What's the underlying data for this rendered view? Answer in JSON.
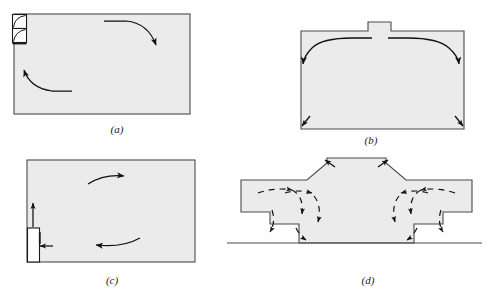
{
  "figure": {
    "panel_count": 4,
    "colors": {
      "background": "#ffffff",
      "room_fill": "#ebebeb",
      "outline": "#4a4a4a",
      "arrow": "#111111",
      "caption": "#1a1a1a",
      "appliance_fill": "#ffffff"
    }
  },
  "panels": [
    {
      "id": "a",
      "caption": "(a)",
      "caption_x": 117,
      "caption_y": 133,
      "description": "Rectangular room with wall-mounted unit on upper left; two curved convection arrows",
      "room": {
        "x": 14,
        "y": 14,
        "width": 176,
        "height": 100
      },
      "features": [
        {
          "name": "wall-unit-upper",
          "x": 13,
          "y": 15,
          "width": 14,
          "height": 14
        },
        {
          "name": "wall-unit-lower",
          "x": 13,
          "y": 29,
          "width": 14,
          "height": 14
        }
      ],
      "arrows": [
        {
          "name": "upper-arc-arrow",
          "direction": "right-then-down"
        },
        {
          "name": "lower-arc-arrow",
          "direction": "left-then-up"
        }
      ]
    },
    {
      "id": "b",
      "caption": "(b)",
      "caption_x": 371,
      "caption_y": 144,
      "description": "Room with central roof stack/chimney; ceiling jets spread outward and down, corner arrows at floor",
      "room": {
        "x": 301,
        "y": 31,
        "width": 163,
        "height": 98
      },
      "features": [
        {
          "name": "roof-stack",
          "x": 368,
          "y": 22,
          "width": 23,
          "height": 10
        }
      ],
      "arrows": [
        {
          "name": "ceiling-jet-left",
          "direction": "left-and-down"
        },
        {
          "name": "ceiling-jet-right",
          "direction": "right-and-down"
        },
        {
          "name": "floor-corner-arrow-left",
          "direction": "down-left"
        },
        {
          "name": "floor-corner-arrow-right",
          "direction": "down-right"
        }
      ]
    },
    {
      "id": "c",
      "caption": "(c)",
      "caption_x": 112,
      "caption_y": 284,
      "description": "Rectangular room with floor-standing heater at left wall; supply arrow in, plume arrow up, circulation loop",
      "room": {
        "x": 27,
        "y": 160,
        "width": 168,
        "height": 102
      },
      "features": [
        {
          "name": "floor-heater",
          "x": 28,
          "y": 228,
          "width": 12,
          "height": 34
        }
      ],
      "arrows": [
        {
          "name": "heater-plume-arrow",
          "direction": "up"
        },
        {
          "name": "heater-inlet-arrow",
          "direction": "left"
        },
        {
          "name": "upper-circulation-arrow",
          "direction": "right"
        },
        {
          "name": "lower-circulation-arrow",
          "direction": "left"
        }
      ]
    },
    {
      "id": "d",
      "caption": "(d)",
      "caption_x": 368,
      "caption_y": 284,
      "description": "Symmetric stepped auditorium cross-section with raised central stage tower; dashed recirculation arrows on both sides",
      "ground_line": {
        "x1": 227,
        "x2": 482,
        "y": 243
      },
      "arrows": [
        {
          "name": "dashed-recirculation-left",
          "direction": "counter-clockwise"
        },
        {
          "name": "dashed-recirculation-right",
          "direction": "clockwise"
        }
      ]
    }
  ]
}
